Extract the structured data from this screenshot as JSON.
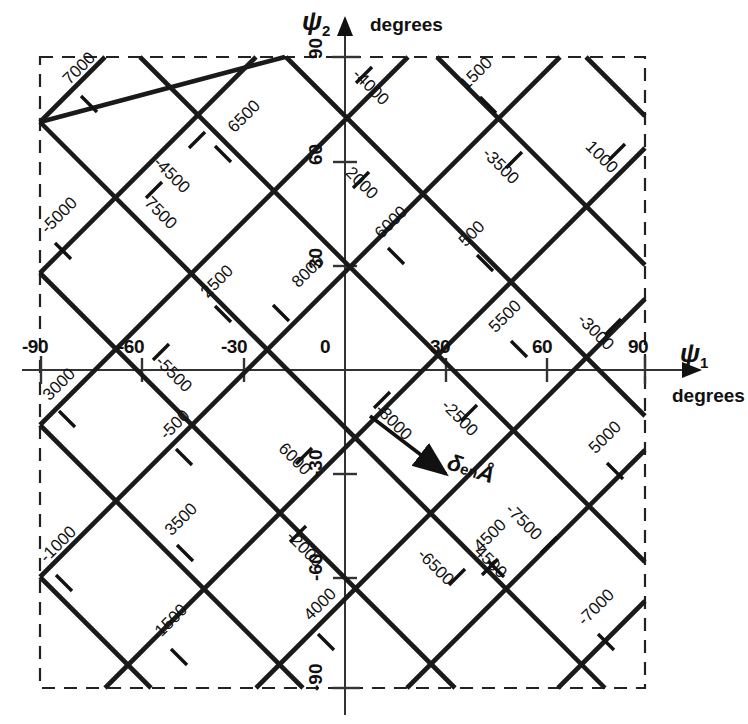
{
  "figure": {
    "background": "#ffffff",
    "ink_color": "#111111",
    "border_style": "dashed"
  },
  "axes": {
    "x": {
      "name": "ψ",
      "subscript": "1",
      "units": "degrees",
      "ticks": [
        -90,
        -60,
        -30,
        0,
        30,
        60,
        90
      ],
      "tick_labels": [
        "-90",
        "-60",
        "-30",
        "0",
        "30",
        "60",
        "90"
      ],
      "range": [
        -90,
        90
      ]
    },
    "y": {
      "name": "ψ",
      "subscript": "2",
      "units": "degrees",
      "ticks": [
        -90,
        -60,
        -30,
        0,
        30,
        60,
        90
      ],
      "tick_labels": [
        "-90",
        "-60",
        "-30",
        "0",
        "30",
        "60",
        "90"
      ],
      "range": [
        -90,
        90
      ]
    }
  },
  "annotation": {
    "symbol": "δ",
    "middle": "en",
    "unit": "Å",
    "full_text": "δ en Å"
  },
  "chart_data": {
    "type": "line",
    "title": "",
    "subtitle": "",
    "xlabel": "ψ₁ degrees",
    "ylabel": "ψ₂ degrees",
    "xlim": [
      -90,
      90
    ],
    "ylim": [
      -90,
      90
    ],
    "grid": false,
    "legend": "none",
    "contour_unit": "Å",
    "series": [
      {
        "name": "positive-slope contours",
        "slope": 1,
        "note": "lines of constant psi2 - psi1 = intercept",
        "lines": [
          {
            "label": "7000",
            "value": 7000,
            "intercept": 135,
            "label_pos": {
              "x": 66,
              "y": 72
            },
            "rot": -45,
            "tick": {
              "x": 89,
              "y": 103
            }
          },
          {
            "label": "-5000",
            "value": -5000,
            "intercept": 90,
            "label_pos": {
              "x": 44,
              "y": 221
            },
            "rot": -45,
            "tick": {
              "x": 62,
              "y": 245
            }
          },
          {
            "label": "6500",
            "value": 6500,
            "intercept": 45,
            "label_pos": {
              "x": 231,
              "y": 120
            },
            "rot": -45,
            "tick": {
              "x": 222,
              "y": 155
            }
          },
          {
            "label": "2500",
            "value": 2500,
            "intercept": 0,
            "label_pos": {
              "x": 204,
              "y": 285
            },
            "rot": -45,
            "tick": {
              "x": 222,
              "y": 313
            }
          },
          {
            "label": "8000",
            "value": 8000,
            "intercept": 0,
            "label_pos": {
              "x": 295,
              "y": 275
            },
            "rot": -45,
            "tick": {
              "x": 280,
              "y": 312
            }
          },
          {
            "label": "6000",
            "value": 6000,
            "intercept": -45,
            "label_pos": {
              "x": 378,
              "y": 226
            },
            "rot": -45,
            "tick": {
              "x": 395,
              "y": 255
            }
          },
          {
            "label": "1500",
            "value": 1500,
            "intercept": 90,
            "label_pos": {
              "x": 463,
              "y": 77
            },
            "rot": -45,
            "tick": {
              "x": 487,
              "y": 104
            }
          },
          {
            "label": "500",
            "value": 500,
            "intercept": -45,
            "label_pos": {
              "x": 462,
              "y": 234
            },
            "rot": -45,
            "tick": {
              "x": 484,
              "y": 262
            }
          },
          {
            "label": "5500",
            "value": 5500,
            "intercept": -90,
            "label_pos": {
              "x": 492,
              "y": 320
            },
            "rot": -45,
            "tick": {
              "x": 518,
              "y": 348
            }
          },
          {
            "label": "3000",
            "value": 3000,
            "intercept": 45,
            "label_pos": {
              "x": 46,
              "y": 388
            },
            "rot": -45,
            "tick": {
              "x": 66,
              "y": 418
            }
          },
          {
            "label": "-500",
            "value": -500,
            "intercept": 0,
            "label_pos": {
              "x": 163,
              "y": 427
            },
            "rot": -45,
            "tick": {
              "x": 183,
              "y": 456
            }
          },
          {
            "label": "3500",
            "value": 3500,
            "intercept": -45,
            "label_pos": {
              "x": 168,
              "y": 523
            },
            "rot": -45,
            "tick": {
              "x": 184,
              "y": 552
            }
          },
          {
            "label": "-1000",
            "value": -1000,
            "intercept": 0,
            "label_pos": {
              "x": 43,
              "y": 550
            },
            "rot": -45,
            "tick": {
              "x": 63,
              "y": 582
            }
          },
          {
            "label": "-1500",
            "value": -1500,
            "intercept": -45,
            "label_pos": {
              "x": 154,
              "y": 628
            },
            "rot": -45,
            "tick": {
              "x": 178,
              "y": 656
            }
          },
          {
            "label": "4000",
            "value": 4000,
            "intercept": -90,
            "label_pos": {
              "x": 307,
              "y": 608
            },
            "rot": -45,
            "tick": {
              "x": 325,
              "y": 641
            }
          },
          {
            "label": "4500",
            "value": 4500,
            "intercept": -135,
            "label_pos": {
              "x": 477,
              "y": 539
            },
            "rot": -45,
            "tick": {
              "x": 495,
              "y": 568
            }
          },
          {
            "label": "5000",
            "value": 5000,
            "intercept": -135,
            "label_pos": {
              "x": 592,
              "y": 441
            },
            "rot": -45,
            "tick": {
              "x": 614,
              "y": 470
            }
          },
          {
            "label": "-7000",
            "value": -7000,
            "intercept": -180,
            "label_pos": {
              "x": 581,
              "y": 613
            },
            "rot": -45,
            "tick": {
              "x": 605,
              "y": 641
            }
          }
        ]
      },
      {
        "name": "negative-slope contours",
        "slope": -1,
        "note": "lines of constant psi2 + psi1 = intercept",
        "lines": [
          {
            "label": "-4500",
            "value": -4500,
            "intercept": 45,
            "label_pos": {
              "x": 156,
              "y": 150
            },
            "rot": 45,
            "tick": {
              "x": 196,
              "y": 140
            }
          },
          {
            "label": "7500",
            "value": 7500,
            "intercept": 0,
            "label_pos": {
              "x": 147,
              "y": 190
            },
            "rot": 45,
            "tick": {
              "x": 153,
              "y": 190
            }
          },
          {
            "label": "-4000",
            "value": -4000,
            "intercept": 135,
            "label_pos": {
              "x": 355,
              "y": 62
            },
            "rot": 45,
            "tick": {
              "x": 363,
              "y": 75
            }
          },
          {
            "label": "2000",
            "value": 2000,
            "intercept": 90,
            "label_pos": {
              "x": 348,
              "y": 160
            },
            "rot": 45,
            "tick": {
              "x": 360,
              "y": 180
            }
          },
          {
            "label": "-3500",
            "value": -3500,
            "intercept": 135,
            "label_pos": {
              "x": 485,
              "y": 141
            },
            "rot": 45,
            "tick": {
              "x": 513,
              "y": 160
            }
          },
          {
            "label": "1000",
            "value": 1000,
            "intercept": 180,
            "label_pos": {
              "x": 588,
              "y": 134
            },
            "rot": 45,
            "tick": {
              "x": 616,
              "y": 152
            }
          },
          {
            "label": "-3000",
            "value": -3000,
            "intercept": 180,
            "label_pos": {
              "x": 580,
              "y": 307
            },
            "rot": 45,
            "tick": {
              "x": 612,
              "y": 327
            }
          },
          {
            "label": "-5500",
            "value": -5500,
            "intercept": -45,
            "label_pos": {
              "x": 158,
              "y": 349
            },
            "rot": 45,
            "tick": {
              "x": 160,
              "y": 352
            }
          },
          {
            "label": "-8000",
            "value": -8000,
            "intercept": 0,
            "label_pos": {
              "x": 378,
              "y": 397
            },
            "rot": 45,
            "tick": {
              "x": 381,
              "y": 400
            }
          },
          {
            "label": "-2500",
            "value": -2500,
            "intercept": 45,
            "label_pos": {
              "x": 444,
              "y": 393
            },
            "rot": 45,
            "tick": {
              "x": 468,
              "y": 413
            }
          },
          {
            "label": "6000",
            "value": 6000,
            "intercept": -45,
            "label_pos": {
              "x": 281,
              "y": 436
            },
            "rot": 45,
            "tick": {
              "x": 303,
              "y": 456
            }
          },
          {
            "label": "-2000",
            "value": -2000,
            "intercept": -45,
            "label_pos": {
              "x": 289,
              "y": 524
            },
            "rot": 45,
            "tick": {
              "x": 297,
              "y": 534
            }
          },
          {
            "label": "-7500",
            "value": -7500,
            "intercept": 0,
            "label_pos": {
              "x": 508,
              "y": 497
            },
            "rot": 45,
            "tick": {
              "x": 548,
              "y": 545
            }
          },
          {
            "label": "-6500",
            "value": -6500,
            "intercept": -90,
            "label_pos": {
              "x": 420,
              "y": 542
            },
            "rot": 45,
            "tick": {
              "x": 456,
              "y": 577
            }
          },
          {
            "label": "4500",
            "value": 4500,
            "intercept": -90,
            "label_pos": {
              "x": 477,
              "y": 539
            },
            "rot": 45,
            "tick": {
              "x": 489,
              "y": 567
            }
          }
        ]
      }
    ]
  },
  "contour_labels": {
    "positive_slope": [
      "7000",
      "-5000",
      "6500",
      "2500",
      "8000",
      "6000",
      "1500",
      "500",
      "5500",
      "3000",
      "-500",
      "3500",
      "-1000",
      "-1500",
      "4000",
      "4500",
      "5000",
      "-7000"
    ],
    "negative_slope": [
      "-4500",
      "7500",
      "-4000",
      "2000",
      "-3500",
      "1000",
      "-3000",
      "-5500",
      "-8000",
      "-2500",
      "6000",
      "-2000",
      "-7500",
      "-6500",
      "4500"
    ]
  }
}
